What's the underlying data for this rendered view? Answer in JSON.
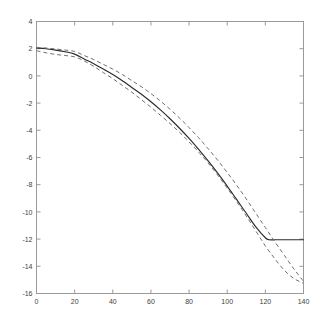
{
  "chart_data": {
    "type": "line",
    "title": "",
    "subtitle": "",
    "xlabel": "",
    "ylabel": "",
    "xlim": [
      0,
      140
    ],
    "ylim": [
      -16,
      4
    ],
    "xticks": [
      0,
      20,
      40,
      60,
      80,
      100,
      120,
      140
    ],
    "yticks": [
      -16,
      -14,
      -12,
      -10,
      -8,
      -6,
      -4,
      -2,
      0,
      2,
      4
    ],
    "xtick_labels": [
      "0",
      "20",
      "40",
      "60",
      "80",
      "100",
      "120",
      "140"
    ],
    "ytick_labels": [
      "-16",
      "-14",
      "-12",
      "-10",
      "-8",
      "-6",
      "-4",
      "-2",
      "0",
      "2",
      "4"
    ],
    "grid": false,
    "legend": null,
    "legend_position": "none",
    "box_frame": true,
    "tick_direction": "in",
    "colors": {
      "axis": "#9a9a9a",
      "solid_line": "#2b2b2b",
      "dashed_line": "#6f6f6f",
      "background": "#ffffff",
      "tick_label": "#3d3d3d"
    },
    "series": [
      {
        "name": "estimate",
        "style": "solid",
        "color": "#2b2b2b",
        "x": [
          0,
          5,
          10,
          15,
          20,
          25,
          30,
          35,
          40,
          45,
          50,
          55,
          60,
          65,
          70,
          75,
          80,
          85,
          90,
          95,
          100,
          105,
          110,
          115,
          120,
          122,
          125,
          130,
          135,
          140
        ],
        "values": [
          2.05,
          2.0,
          1.9,
          1.78,
          1.6,
          1.25,
          0.9,
          0.5,
          0.1,
          -0.35,
          -0.85,
          -1.35,
          -1.9,
          -2.5,
          -3.15,
          -3.85,
          -4.6,
          -5.4,
          -6.25,
          -7.15,
          -8.1,
          -9.1,
          -10.1,
          -11.1,
          -11.9,
          -12.05,
          -12.05,
          -12.05,
          -12.05,
          -12.05
        ]
      },
      {
        "name": "upper-band",
        "style": "dashed",
        "color": "#6f6f6f",
        "x": [
          0,
          5,
          10,
          15,
          20,
          25,
          30,
          35,
          40,
          45,
          50,
          55,
          60,
          65,
          70,
          75,
          80,
          85,
          90,
          95,
          100,
          105,
          110,
          115,
          120,
          125,
          130,
          135,
          140
        ],
        "values": [
          2.1,
          2.05,
          1.98,
          1.9,
          1.8,
          1.5,
          1.2,
          0.85,
          0.5,
          0.1,
          -0.35,
          -0.8,
          -1.3,
          -1.85,
          -2.45,
          -3.1,
          -3.8,
          -4.55,
          -5.35,
          -6.2,
          -7.1,
          -8.05,
          -9.05,
          -10.1,
          -11.15,
          -12.2,
          -13.2,
          -14.2,
          -15.1
        ]
      },
      {
        "name": "lower-band",
        "style": "dashed",
        "color": "#6f6f6f",
        "x": [
          0,
          5,
          10,
          15,
          20,
          25,
          30,
          35,
          40,
          45,
          50,
          55,
          60,
          65,
          70,
          75,
          80,
          85,
          90,
          95,
          100,
          105,
          110,
          115,
          120,
          125,
          130,
          135,
          140
        ],
        "values": [
          1.85,
          1.7,
          1.58,
          1.5,
          1.4,
          1.1,
          0.7,
          0.25,
          -0.2,
          -0.7,
          -1.2,
          -1.75,
          -2.3,
          -2.9,
          -3.5,
          -4.15,
          -4.85,
          -5.6,
          -6.4,
          -7.3,
          -8.25,
          -9.25,
          -10.3,
          -11.4,
          -12.5,
          -13.45,
          -14.3,
          -14.9,
          -15.25
        ]
      }
    ]
  }
}
